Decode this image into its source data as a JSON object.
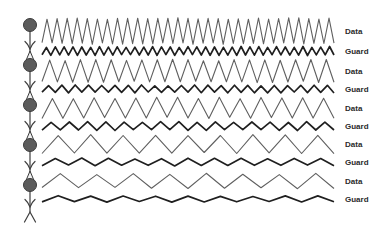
{
  "figure": {
    "background": "#ffffff",
    "wave_x_start": 42,
    "wave_x_end": 334,
    "label_x": 345,
    "rows": [
      {
        "label": "Data",
        "kind": "data",
        "y": 31,
        "amplitude": 12.5,
        "periods": 29
      },
      {
        "label": "Guard",
        "kind": "guard",
        "y": 51,
        "amplitude": 4,
        "periods": 33
      },
      {
        "label": "Data",
        "kind": "data",
        "y": 71,
        "amplitude": 11,
        "periods": 19
      },
      {
        "label": "Guard",
        "kind": "guard",
        "y": 89,
        "amplitude": 3.5,
        "periods": 22
      },
      {
        "label": "Data",
        "kind": "data",
        "y": 108,
        "amplitude": 10,
        "periods": 14
      },
      {
        "label": "Guard",
        "kind": "guard",
        "y": 126,
        "amplitude": 4,
        "periods": 16
      },
      {
        "label": "Data",
        "kind": "data",
        "y": 144,
        "amplitude": 9,
        "periods": 9
      },
      {
        "label": "Guard",
        "kind": "guard",
        "y": 162,
        "amplitude": 3.5,
        "periods": 11
      },
      {
        "label": "Data",
        "kind": "data",
        "y": 181,
        "amplitude": 7,
        "periods": 8
      },
      {
        "label": "Guard",
        "kind": "guard",
        "y": 199,
        "amplitude": 3,
        "periods": 9
      }
    ],
    "chain": {
      "x": 30,
      "head_node_y": 25,
      "balloon_node_ys": [
        65,
        105,
        145,
        185
      ],
      "arrow_ys": [
        46,
        86,
        126,
        166,
        204
      ],
      "node_radius": 6.5,
      "tail_split_y": 212,
      "tail_end_y": 222,
      "tail_spread": 5.5
    },
    "palette": {
      "data_line": "#5f5f5f",
      "guard_line": "#1f1f1f",
      "label_text": "#2b2b2b",
      "node_fill": "#5c5c5c",
      "node_stroke": "#3a3a3a",
      "chain_line": "#3d3d3d",
      "balloon_tip_fill": "#f0f0f0"
    }
  }
}
